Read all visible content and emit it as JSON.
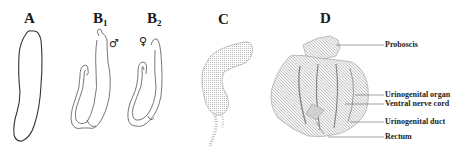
{
  "panels": {
    "A": {
      "label": "A"
    },
    "B1": {
      "label": "B",
      "sub": "1",
      "sex_symbol": "♂"
    },
    "B2": {
      "label": "B",
      "sub": "2",
      "sex_symbol": "♀"
    },
    "C": {
      "label": "C"
    },
    "D": {
      "label": "D",
      "annotations": [
        {
          "text": "Proboscis"
        },
        {
          "text": "Urinogenital organ"
        },
        {
          "text": "Ventral nerve cord"
        },
        {
          "text": "Urinogenital duct"
        },
        {
          "text": "Rectum"
        }
      ]
    }
  },
  "colors": {
    "line": "#444444",
    "shade": "#9a9a9a"
  }
}
